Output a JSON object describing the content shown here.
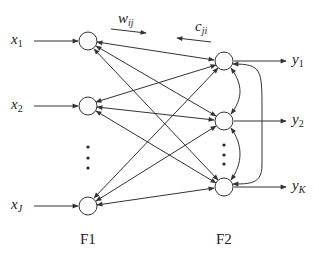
{
  "diagram": {
    "type": "ART neural network (two-layer bidirectional)",
    "colors": {
      "line": "#333333",
      "text": "#222222",
      "background": "#ffffff"
    },
    "inputs": [
      {
        "var": "x",
        "sub": "1"
      },
      {
        "var": "x",
        "sub": "2"
      },
      {
        "var": "x",
        "sub": "J"
      }
    ],
    "outputs": [
      {
        "var": "y",
        "sub": "1"
      },
      {
        "var": "y",
        "sub": "2"
      },
      {
        "var": "y",
        "sub": "K"
      }
    ],
    "weights": {
      "forward": {
        "var": "w",
        "sub": "ij"
      },
      "backward": {
        "var": "c",
        "sub": "ji"
      }
    },
    "layers": {
      "f1": "F1",
      "f2": "F2"
    },
    "ellipsis": "⋮",
    "f1_nodes": [
      [
        88,
        41
      ],
      [
        88,
        106
      ],
      [
        88,
        206
      ]
    ],
    "f2_nodes": [
      [
        224,
        61
      ],
      [
        224,
        121
      ],
      [
        224,
        187
      ]
    ]
  }
}
